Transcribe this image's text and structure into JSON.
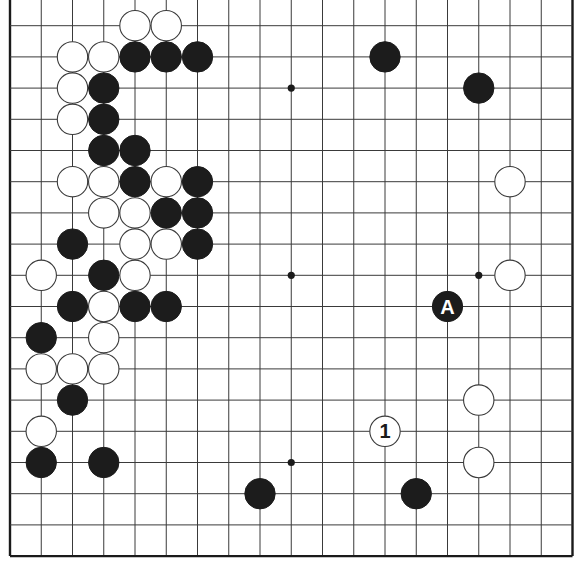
{
  "diagram": {
    "type": "go-board",
    "board_size": 19,
    "visible_rows": "rows 1-18 (top row cut off; left, right and bottom edges shown)",
    "colors": {
      "black": "#1c1c1c",
      "white": "#ffffff",
      "line": "#3a3a3a",
      "background": "#ffffff"
    },
    "star_points": [
      {
        "col": 9,
        "row": 3
      },
      {
        "col": 9,
        "row": 9
      },
      {
        "col": 15,
        "row": 9
      },
      {
        "col": 9,
        "row": 15
      }
    ],
    "stones": [
      {
        "color": "white",
        "col": 4,
        "row": 1
      },
      {
        "color": "white",
        "col": 5,
        "row": 1
      },
      {
        "color": "white",
        "col": 2,
        "row": 2
      },
      {
        "color": "white",
        "col": 3,
        "row": 2
      },
      {
        "color": "black",
        "col": 4,
        "row": 2
      },
      {
        "color": "black",
        "col": 5,
        "row": 2
      },
      {
        "color": "black",
        "col": 6,
        "row": 2
      },
      {
        "color": "black",
        "col": 12,
        "row": 2
      },
      {
        "color": "white",
        "col": 2,
        "row": 3
      },
      {
        "color": "black",
        "col": 3,
        "row": 3
      },
      {
        "color": "black",
        "col": 15,
        "row": 3
      },
      {
        "color": "white",
        "col": 2,
        "row": 4
      },
      {
        "color": "black",
        "col": 3,
        "row": 4
      },
      {
        "color": "black",
        "col": 3,
        "row": 5
      },
      {
        "color": "black",
        "col": 4,
        "row": 5
      },
      {
        "color": "white",
        "col": 2,
        "row": 6
      },
      {
        "color": "white",
        "col": 3,
        "row": 6
      },
      {
        "color": "black",
        "col": 4,
        "row": 6
      },
      {
        "color": "white",
        "col": 5,
        "row": 6
      },
      {
        "color": "black",
        "col": 6,
        "row": 6
      },
      {
        "color": "white",
        "col": 16,
        "row": 6
      },
      {
        "color": "white",
        "col": 3,
        "row": 7
      },
      {
        "color": "white",
        "col": 4,
        "row": 7
      },
      {
        "color": "black",
        "col": 5,
        "row": 7
      },
      {
        "color": "black",
        "col": 6,
        "row": 7
      },
      {
        "color": "black",
        "col": 2,
        "row": 8
      },
      {
        "color": "white",
        "col": 4,
        "row": 8
      },
      {
        "color": "white",
        "col": 5,
        "row": 8
      },
      {
        "color": "black",
        "col": 6,
        "row": 8
      },
      {
        "color": "white",
        "col": 1,
        "row": 9
      },
      {
        "color": "black",
        "col": 3,
        "row": 9
      },
      {
        "color": "white",
        "col": 4,
        "row": 9
      },
      {
        "color": "white",
        "col": 16,
        "row": 9
      },
      {
        "color": "black",
        "col": 2,
        "row": 10
      },
      {
        "color": "white",
        "col": 3,
        "row": 10
      },
      {
        "color": "black",
        "col": 4,
        "row": 10
      },
      {
        "color": "black",
        "col": 5,
        "row": 10
      },
      {
        "color": "black",
        "col": 14,
        "row": 10,
        "label": "A"
      },
      {
        "color": "black",
        "col": 1,
        "row": 11
      },
      {
        "color": "white",
        "col": 3,
        "row": 11
      },
      {
        "color": "white",
        "col": 1,
        "row": 12
      },
      {
        "color": "white",
        "col": 2,
        "row": 12
      },
      {
        "color": "white",
        "col": 3,
        "row": 12
      },
      {
        "color": "black",
        "col": 2,
        "row": 13
      },
      {
        "color": "white",
        "col": 15,
        "row": 13
      },
      {
        "color": "white",
        "col": 1,
        "row": 14
      },
      {
        "color": "white",
        "col": 12,
        "row": 14,
        "label": "1"
      },
      {
        "color": "black",
        "col": 1,
        "row": 15
      },
      {
        "color": "black",
        "col": 3,
        "row": 15
      },
      {
        "color": "white",
        "col": 15,
        "row": 15
      },
      {
        "color": "black",
        "col": 8,
        "row": 16
      },
      {
        "color": "black",
        "col": 13,
        "row": 16
      }
    ],
    "labels": {
      "move_number": "1",
      "marker": "A"
    }
  }
}
